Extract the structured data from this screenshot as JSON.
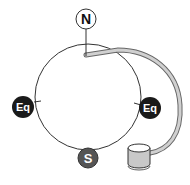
{
  "diagram": {
    "labels": {
      "north": "N",
      "south": "S",
      "equator_left": "Eq",
      "equator_right": "Eq"
    },
    "colors": {
      "circle_stroke": "#333333",
      "north_fill": "#ffffff",
      "south_fill": "#555555",
      "equator_fill": "#1a1a1a",
      "tube_fill": "#d0d0d0",
      "canister_fill": "#c8c8c8"
    }
  }
}
